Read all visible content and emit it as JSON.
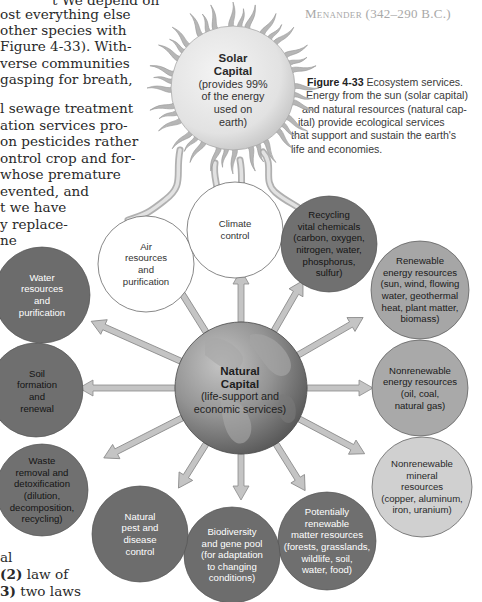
{
  "page": {
    "quote_attribution": "Menander (342–290 B.C.)",
    "body_text_top": [
      "t   We depend on",
      "ost everything else",
      " other species with",
      "Figure 4-33). With-",
      "verse communities",
      "gasping for breath,",
      "",
      "l sewage treatment",
      "ation services pro-",
      "on pesticides rather",
      "ontrol crop and for-",
      " whose premature",
      "evented,   and",
      "t  we  have",
      "y  replace-",
      "ne"
    ],
    "body_text_bottom": [
      "al",
      "(2) law of",
      "3) two laws",
      "ults  of  basic"
    ],
    "body_text_bottom_bold": [
      "(2)",
      "3)"
    ]
  },
  "caption": {
    "figure_label": "Figure 4-33",
    "lines": [
      " Ecosystem services.",
      "Energy from the sun (solar capital)",
      "and natural resources (natural cap-",
      "ital) provide ecological services",
      "that support and sustain the earth's",
      "life and economies."
    ]
  },
  "diagram": {
    "sun": {
      "title_line1": "Solar",
      "title_line2": "Capital",
      "subtitle": "(provides 99%\nof the energy\nused on\nearth)"
    },
    "globe": {
      "title": "Natural\nCapital",
      "subtitle": "(life-support and\neconomic services)"
    },
    "services": [
      {
        "id": "air",
        "label": "Air\nresources\nand\npurification",
        "style": "light"
      },
      {
        "id": "climate",
        "label": "Climate\ncontrol",
        "style": "light"
      },
      {
        "id": "recycling",
        "label": "Recycling\nvital chemicals\n(carbon, oxygen,\nnitrogen, water,\nphosphorus,\nsulfur)",
        "style": "dark-black"
      },
      {
        "id": "renewable-energy",
        "label": "Renewable\nenergy resources\n(sun, wind, flowing\nwater, geothermal\nheat, plant matter,\nbiomass)",
        "style": "medium"
      },
      {
        "id": "nonrenewable-energy",
        "label": "Nonrenewable\nenergy resources\n(oil, coal,\nnatural gas)",
        "style": "medium"
      },
      {
        "id": "nonrenewable-mineral",
        "label": "Nonrenewable\nmineral\nresources\n(copper, aluminum,\niron, uranium)",
        "style": "light-gray"
      },
      {
        "id": "potentially-renewable",
        "label": "Potentially\nrenewable\nmatter resources\n(forests, grasslands,\nwildlife, soil,\nwater, food)",
        "style": "dark"
      },
      {
        "id": "biodiversity",
        "label": "Biodiversity\nand gene pool\n(for adaptation\nto changing\nconditions)",
        "style": "dark"
      },
      {
        "id": "pest-control",
        "label": "Natural\npest and\ndisease\ncontrol",
        "style": "dark"
      },
      {
        "id": "waste",
        "label": "Waste\nremoval and\ndetoxification\n(dilution,\ndecomposition,\nrecycling)",
        "style": "dark-black"
      },
      {
        "id": "soil",
        "label": "Soil\nformation\nand\nrenewal",
        "style": "dark-black"
      },
      {
        "id": "water",
        "label": "Water\nresources\nand\npurification",
        "style": "dark"
      }
    ],
    "colors": {
      "dark_circle": "#6e6e6e",
      "medium_circle": "#a9a9a9",
      "light_gray_circle": "#cfcfcf",
      "white_circle": "#ffffff",
      "arrow_fill": "#c4c4c4",
      "sun_fill": "#e6e6e6",
      "sun_rays": "#b4b4b4",
      "globe_fill": "#8d8d8d"
    }
  }
}
